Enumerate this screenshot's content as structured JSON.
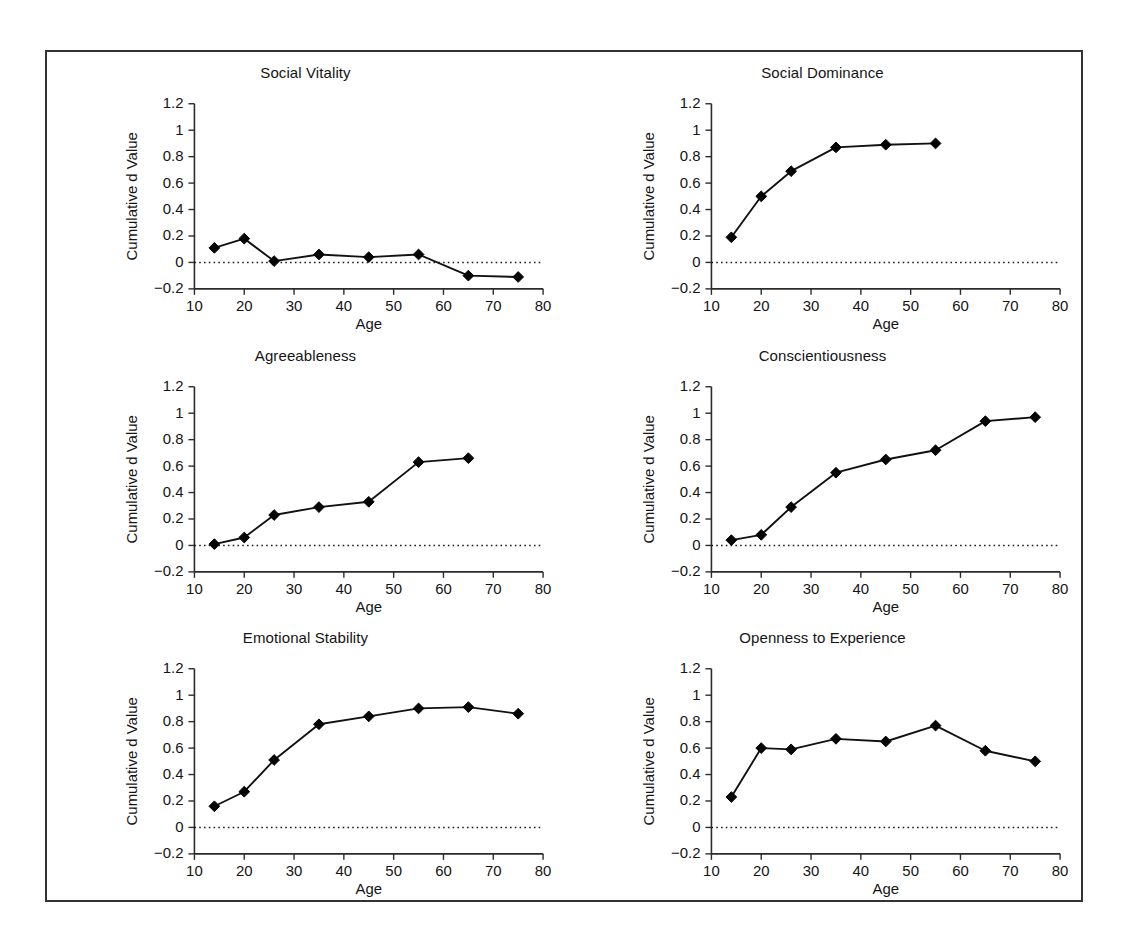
{
  "figure": {
    "background": "#ffffff",
    "frame_color": "#333333",
    "line_color": "#111111",
    "marker_color": "#050505"
  },
  "chart_data": [
    {
      "type": "line",
      "title": "Social Vitality",
      "xlabel": "Age",
      "ylabel": "Cumulative d Value",
      "x": [
        14,
        20,
        26,
        35,
        45,
        55,
        65,
        75
      ],
      "values": [
        0.11,
        0.18,
        0.01,
        0.06,
        0.04,
        0.06,
        -0.1,
        -0.11
      ],
      "xlim": [
        10,
        80
      ],
      "ylim": [
        -0.2,
        1.2
      ],
      "xticks": [
        10,
        20,
        30,
        40,
        50,
        60,
        70,
        80
      ],
      "yticks": [
        -0.2,
        0,
        0.2,
        0.4,
        0.6,
        0.8,
        1,
        1.2
      ],
      "xticklabels": [
        "10",
        "20",
        "30",
        "40",
        "50",
        "60",
        "70",
        "80"
      ],
      "yticklabels": [
        "-0.2",
        "0",
        "0.2",
        "0.4",
        "0.6",
        "0.8",
        "1",
        "1.2"
      ],
      "grid": false,
      "legend": "none",
      "zero_reference_line": 0,
      "marker": "diamond"
    },
    {
      "type": "line",
      "title": "Social Dominance",
      "xlabel": "Age",
      "ylabel": "Cumulative d Value",
      "x": [
        14,
        20,
        26,
        35,
        45,
        55
      ],
      "values": [
        0.19,
        0.5,
        0.69,
        0.87,
        0.89,
        0.9
      ],
      "xlim": [
        10,
        80
      ],
      "ylim": [
        -0.2,
        1.2
      ],
      "xticks": [
        10,
        20,
        30,
        40,
        50,
        60,
        70,
        80
      ],
      "yticks": [
        -0.2,
        0,
        0.2,
        0.4,
        0.6,
        0.8,
        1,
        1.2
      ],
      "xticklabels": [
        "10",
        "20",
        "30",
        "40",
        "50",
        "60",
        "70",
        "80"
      ],
      "yticklabels": [
        "-0.2",
        "0",
        "0.2",
        "0.4",
        "0.6",
        "0.8",
        "1",
        "1.2"
      ],
      "grid": false,
      "legend": "none",
      "zero_reference_line": 0,
      "marker": "diamond"
    },
    {
      "type": "line",
      "title": "Agreeableness",
      "xlabel": "Age",
      "ylabel": "Cumulative d Value",
      "x": [
        14,
        20,
        26,
        35,
        45,
        55,
        65
      ],
      "values": [
        0.01,
        0.06,
        0.23,
        0.29,
        0.33,
        0.63,
        0.66
      ],
      "xlim": [
        10,
        80
      ],
      "ylim": [
        -0.2,
        1.2
      ],
      "xticks": [
        10,
        20,
        30,
        40,
        50,
        60,
        70,
        80
      ],
      "yticks": [
        -0.2,
        0,
        0.2,
        0.4,
        0.6,
        0.8,
        1,
        1.2
      ],
      "xticklabels": [
        "10",
        "20",
        "30",
        "40",
        "50",
        "60",
        "70",
        "80"
      ],
      "yticklabels": [
        "-0.2",
        "0",
        "0.2",
        "0.4",
        "0.6",
        "0.8",
        "1",
        "1.2"
      ],
      "grid": false,
      "legend": "none",
      "zero_reference_line": 0,
      "marker": "diamond"
    },
    {
      "type": "line",
      "title": "Conscientiousness",
      "xlabel": "Age",
      "ylabel": "Cumulative d Value",
      "x": [
        14,
        20,
        26,
        35,
        45,
        55,
        65,
        75
      ],
      "values": [
        0.04,
        0.08,
        0.29,
        0.55,
        0.65,
        0.72,
        0.94,
        0.97
      ],
      "xlim": [
        10,
        80
      ],
      "ylim": [
        -0.2,
        1.2
      ],
      "xticks": [
        10,
        20,
        30,
        40,
        50,
        60,
        70,
        80
      ],
      "yticks": [
        -0.2,
        0,
        0.2,
        0.4,
        0.6,
        0.8,
        1,
        1.2
      ],
      "xticklabels": [
        "10",
        "20",
        "30",
        "40",
        "50",
        "60",
        "70",
        "80"
      ],
      "yticklabels": [
        "-0.2",
        "0",
        "0.2",
        "0.4",
        "0.6",
        "0.8",
        "1",
        "1.2"
      ],
      "grid": false,
      "legend": "none",
      "zero_reference_line": 0,
      "marker": "diamond"
    },
    {
      "type": "line",
      "title": "Emotional Stability",
      "xlabel": "Age",
      "ylabel": "Cumulative d Value",
      "x": [
        14,
        20,
        26,
        35,
        45,
        55,
        65,
        75
      ],
      "values": [
        0.16,
        0.27,
        0.51,
        0.78,
        0.84,
        0.9,
        0.91,
        0.86
      ],
      "xlim": [
        10,
        80
      ],
      "ylim": [
        -0.2,
        1.2
      ],
      "xticks": [
        10,
        20,
        30,
        40,
        50,
        60,
        70,
        80
      ],
      "yticks": [
        -0.2,
        0,
        0.2,
        0.4,
        0.6,
        0.8,
        1,
        1.2
      ],
      "xticklabels": [
        "10",
        "20",
        "30",
        "40",
        "50",
        "60",
        "70",
        "80"
      ],
      "yticklabels": [
        "-0.2",
        "0",
        "0.2",
        "0.4",
        "0.6",
        "0.8",
        "1",
        "1.2"
      ],
      "grid": false,
      "legend": "none",
      "zero_reference_line": 0,
      "marker": "diamond"
    },
    {
      "type": "line",
      "title": "Openness to Experience",
      "xlabel": "Age",
      "ylabel": "Cumulative d Value",
      "x": [
        14,
        20,
        26,
        35,
        45,
        55,
        65,
        75
      ],
      "values": [
        0.23,
        0.6,
        0.59,
        0.67,
        0.65,
        0.77,
        0.58,
        0.5
      ],
      "xlim": [
        10,
        80
      ],
      "ylim": [
        -0.2,
        1.2
      ],
      "xticks": [
        10,
        20,
        30,
        40,
        50,
        60,
        70,
        80
      ],
      "yticks": [
        -0.2,
        0,
        0.2,
        0.4,
        0.6,
        0.8,
        1,
        1.2
      ],
      "xticklabels": [
        "10",
        "20",
        "30",
        "40",
        "50",
        "60",
        "70",
        "80"
      ],
      "yticklabels": [
        "-0.2",
        "0",
        "0.2",
        "0.4",
        "0.6",
        "0.8",
        "1",
        "1.2"
      ],
      "grid": false,
      "legend": "none",
      "zero_reference_line": 0,
      "marker": "diamond"
    }
  ]
}
